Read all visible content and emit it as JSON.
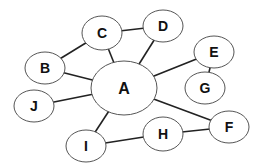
{
  "diagram": {
    "type": "network-graph",
    "stroke_color": "#222222",
    "node_fill": "#ffffff",
    "nodes": [
      {
        "id": "A",
        "label": "A",
        "cx": 124,
        "cy": 88,
        "rx": 33,
        "ry": 27
      },
      {
        "id": "B",
        "label": "B",
        "cx": 45,
        "cy": 68,
        "rx": 20,
        "ry": 16
      },
      {
        "id": "C",
        "label": "C",
        "cx": 102,
        "cy": 33,
        "rx": 20,
        "ry": 17
      },
      {
        "id": "D",
        "label": "D",
        "cx": 163,
        "cy": 26,
        "rx": 20,
        "ry": 16
      },
      {
        "id": "E",
        "label": "E",
        "cx": 214,
        "cy": 52,
        "rx": 20,
        "ry": 16
      },
      {
        "id": "G",
        "label": "G",
        "cx": 205,
        "cy": 88,
        "rx": 20,
        "ry": 16
      },
      {
        "id": "J",
        "label": "J",
        "cx": 34,
        "cy": 106,
        "rx": 20,
        "ry": 16
      },
      {
        "id": "I",
        "label": "I",
        "cx": 86,
        "cy": 146,
        "rx": 20,
        "ry": 16
      },
      {
        "id": "H",
        "label": "H",
        "cx": 163,
        "cy": 134,
        "rx": 20,
        "ry": 17
      },
      {
        "id": "F",
        "label": "F",
        "cx": 229,
        "cy": 127,
        "rx": 20,
        "ry": 16
      }
    ],
    "edges": [
      {
        "from": "B",
        "to": "C"
      },
      {
        "from": "B",
        "to": "A"
      },
      {
        "from": "C",
        "to": "A"
      },
      {
        "from": "C",
        "to": "D"
      },
      {
        "from": "D",
        "to": "A"
      },
      {
        "from": "A",
        "to": "E"
      },
      {
        "from": "E",
        "to": "G"
      },
      {
        "from": "A",
        "to": "J"
      },
      {
        "from": "A",
        "to": "I"
      },
      {
        "from": "A",
        "to": "F"
      },
      {
        "from": "I",
        "to": "H"
      },
      {
        "from": "H",
        "to": "F"
      }
    ]
  }
}
